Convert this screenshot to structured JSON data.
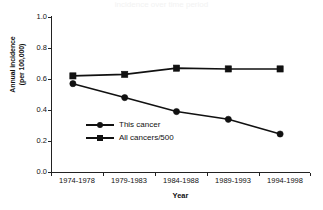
{
  "figure": {
    "clipped_title": "incidence over time period"
  },
  "chart_data": {
    "type": "line",
    "title": "",
    "xlabel": "Year",
    "ylabel": "Annual incidence (per 100,000)",
    "ylabel_line1": "Annual incidence",
    "ylabel_line2": "(per 100,000)",
    "categories": [
      "1974-1978",
      "1979-1983",
      "1984-1988",
      "1989-1993",
      "1994-1998"
    ],
    "ylim": [
      0.0,
      1.0
    ],
    "yticks": [
      "1.0",
      "0.8",
      "0.6",
      "0.4",
      "0.2",
      "0.0"
    ],
    "ytick_values": [
      1.0,
      0.8,
      0.6,
      0.4,
      0.2,
      0.0
    ],
    "grid": false,
    "legend_position": "center-left-inside",
    "series": [
      {
        "name": "This cancer",
        "marker": "circle",
        "color": "#111111",
        "values": [
          0.57,
          0.48,
          0.39,
          0.34,
          0.245
        ]
      },
      {
        "name": "All cancers/500",
        "marker": "square",
        "color": "#111111",
        "values": [
          0.62,
          0.63,
          0.67,
          0.665,
          0.665
        ]
      }
    ]
  },
  "legend": {
    "items": [
      {
        "label": "This cancer",
        "marker": "circle-marker"
      },
      {
        "label": "All cancers/500",
        "marker": "square-marker"
      }
    ]
  }
}
